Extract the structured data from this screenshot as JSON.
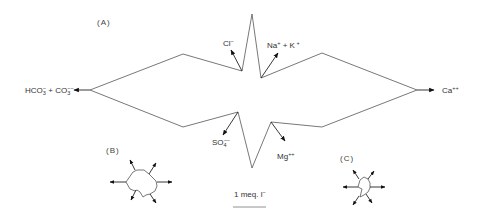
{
  "diagram": {
    "type": "stiff-pattern-ion-diagram",
    "panels": [
      {
        "id": "A",
        "label": "(A)"
      },
      {
        "id": "B",
        "label": "(B)"
      },
      {
        "id": "C",
        "label": "(C)"
      }
    ],
    "ions": {
      "hco3_co3": {
        "base": "HCO",
        "sub1": "3",
        "sup1": "−",
        "plus": " + CO",
        "sub2": "3",
        "sup2": "−−"
      },
      "cl": {
        "base": "Cl",
        "sup": "−"
      },
      "na_k": {
        "base1": "Na",
        "sup1": "+",
        "plus": " + K",
        "sup2": " +"
      },
      "ca": {
        "base": "Ca",
        "sup": "++"
      },
      "so4": {
        "base": "SO",
        "sub": "4",
        "sup": "−−"
      },
      "mg": {
        "base": "Mg",
        "sup": "++"
      }
    },
    "scale_bar": {
      "label_prefix": "1 meq. l",
      "label_sup": "−"
    },
    "colors": {
      "line": "#555555",
      "arrow": "#222222",
      "text": "#333333",
      "background": "#ffffff"
    }
  }
}
